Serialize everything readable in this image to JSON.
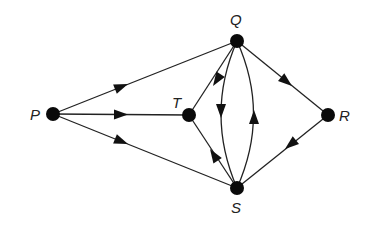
{
  "diagram": {
    "type": "directed-graph",
    "nodes": [
      {
        "id": "P",
        "label": "P",
        "x": 53,
        "y": 114,
        "label_x": 30,
        "label_y": 120
      },
      {
        "id": "T",
        "label": "T",
        "x": 189,
        "y": 115,
        "label_x": 172,
        "label_y": 108
      },
      {
        "id": "Q",
        "label": "Q",
        "x": 237,
        "y": 41,
        "label_x": 230,
        "label_y": 25
      },
      {
        "id": "R",
        "label": "R",
        "x": 328,
        "y": 115,
        "label_x": 339,
        "label_y": 121
      },
      {
        "id": "S",
        "label": "S",
        "x": 237,
        "y": 188,
        "label_x": 231,
        "label_y": 213
      }
    ],
    "edges": [
      {
        "from": "P",
        "to": "Q",
        "shape": "straight"
      },
      {
        "from": "P",
        "to": "T",
        "shape": "straight"
      },
      {
        "from": "P",
        "to": "S",
        "shape": "straight"
      },
      {
        "from": "Q",
        "to": "T",
        "shape": "straight"
      },
      {
        "from": "Q",
        "to": "S",
        "shape": "curved-left"
      },
      {
        "from": "S",
        "to": "Q",
        "shape": "curved-right"
      },
      {
        "from": "S",
        "to": "T",
        "shape": "straight"
      },
      {
        "from": "Q",
        "to": "R",
        "shape": "straight"
      },
      {
        "from": "R",
        "to": "S",
        "shape": "straight"
      }
    ],
    "colors": {
      "edge": "#222222",
      "node": "#0a0a0a",
      "background": "#ffffff"
    }
  }
}
